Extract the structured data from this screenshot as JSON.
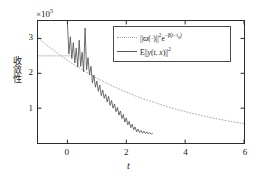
{
  "chart_data": {
    "type": "line",
    "title": "",
    "xlabel": "t",
    "ylabel": "收敛性",
    "y_multiplier": "×10",
    "y_multiplier_exp": "5",
    "xlim": [
      -1,
      6
    ],
    "ylim": [
      0,
      3.5
    ],
    "xticks": [
      0,
      2,
      4,
      6
    ],
    "xticklabels": [
      "0",
      "2",
      "4",
      "6"
    ],
    "yticks": [
      1,
      2,
      3
    ],
    "yticklabels": [
      "1",
      "2",
      "3"
    ],
    "grid": false,
    "legend_position": "upper right",
    "series": [
      {
        "name": "bound",
        "legend_label": "||ϖ(·)||²e^{-β(t-t₀)}",
        "style": "dotted",
        "color": "#a8a8a8",
        "x": [
          -1,
          -0.6,
          -0.2,
          0.2,
          0.6,
          1.0,
          1.4,
          1.8,
          2.2,
          2.6,
          3.0,
          3.4,
          3.8,
          4.2,
          4.6,
          5.0,
          5.4,
          5.8,
          6.0
        ],
        "y": [
          3.02,
          2.74,
          2.49,
          2.26,
          2.05,
          1.86,
          1.69,
          1.53,
          1.39,
          1.26,
          1.15,
          1.04,
          0.945,
          0.858,
          0.779,
          0.707,
          0.642,
          0.583,
          0.555
        ]
      },
      {
        "name": "expectation",
        "legend_label": "E||y(t, x)||²",
        "style": "solid",
        "color": "#555555",
        "x": [
          0.0,
          0.05,
          0.1,
          0.15,
          0.2,
          0.25,
          0.3,
          0.35,
          0.4,
          0.45,
          0.5,
          0.55,
          0.6,
          0.65,
          0.7,
          0.75,
          0.8,
          0.85,
          0.9,
          0.95,
          1.0,
          1.05,
          1.1,
          1.15,
          1.2,
          1.25,
          1.3,
          1.35,
          1.4,
          1.45,
          1.5,
          1.55,
          1.6,
          1.65,
          1.7,
          1.75,
          1.8,
          1.85,
          1.9,
          1.95,
          2.0,
          2.05,
          2.1,
          2.15,
          2.2,
          2.25,
          2.3,
          2.35,
          2.4,
          2.45,
          2.5,
          2.55,
          2.6,
          2.65,
          2.7,
          2.75,
          2.8,
          2.85,
          2.9
        ],
        "y": [
          3.45,
          2.55,
          3.05,
          2.42,
          2.88,
          2.3,
          2.72,
          2.18,
          2.95,
          2.2,
          2.6,
          2.05,
          3.3,
          2.1,
          2.45,
          1.95,
          2.2,
          1.72,
          1.95,
          1.6,
          1.78,
          1.48,
          1.66,
          1.36,
          1.52,
          1.28,
          1.4,
          1.18,
          1.34,
          1.08,
          1.22,
          1.0,
          1.12,
          0.9,
          1.02,
          0.8,
          0.92,
          0.7,
          0.82,
          0.6,
          0.72,
          0.52,
          0.62,
          0.44,
          0.54,
          0.38,
          0.46,
          0.32,
          0.4,
          0.3,
          0.36,
          0.28,
          0.34,
          0.27,
          0.32,
          0.26,
          0.3,
          0.26,
          0.28
        ]
      },
      {
        "name": "reference-segment",
        "legend_label": "",
        "style": "solid-thin",
        "color": "#bdbdbd",
        "x": [
          -1.0,
          0.18
        ],
        "y": [
          2.5,
          2.5
        ]
      }
    ]
  },
  "legend": {
    "entries": [
      {
        "key_style": "dotted",
        "parts": {
          "norm_open": "||",
          "symbol": "ϖ",
          "arg": "(·)",
          "norm_close": "||",
          "power": "2",
          "exp_base": "e",
          "exp_body": "−β(t−t",
          "exp_sub": "0",
          "exp_tail": ")"
        }
      },
      {
        "key_style": "solid",
        "parts": {
          "operator": "E",
          "norm_open": "||",
          "fn": "y",
          "args_open": "(",
          "arg1": "t",
          "comma": ", ",
          "arg2": "x",
          "args_close": ")",
          "norm_close": "||",
          "power": "2"
        }
      }
    ]
  },
  "axes": {
    "multiplier_text": "×10",
    "multiplier_exp": "5",
    "x_title": "t",
    "y_title": "收敛性"
  }
}
